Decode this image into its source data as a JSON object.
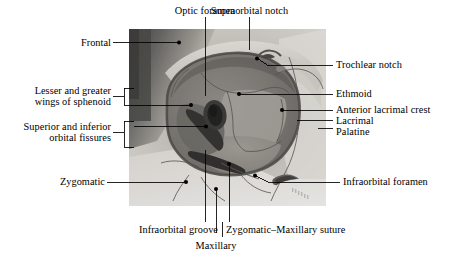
{
  "figure": {
    "image_kind": "grayscale-anatomical-photograph",
    "background_color": "#ffffff",
    "text_color": "#000000",
    "leader_color": "#000000"
  },
  "labels": {
    "optic_foramen": "Optic foramen",
    "supraorbital_notch": "Supraorbital notch",
    "frontal": "Frontal",
    "trochlear_notch": "Trochlear notch",
    "lesser_greater_wings_line1": "Lesser and greater",
    "lesser_greater_wings_line2": "wings of sphenoid",
    "ethmoid": "Ethmoid",
    "anterior_lacrimal_crest": "Anterior lacrimal crest",
    "lacrimal": "Lacrimal",
    "palatine": "Palatine",
    "orbital_fissures_line1": "Superior and inferior",
    "orbital_fissures_line2": "orbital fissures",
    "zygomatic": "Zygomatic",
    "infraorbital_foramen": "Infraorbital foramen",
    "infraorbital_groove": "Infraorbital groove",
    "zygomatic_maxillary_suture": "Zygomatic–Maxillary suture",
    "maxillary": "Maxillary"
  }
}
